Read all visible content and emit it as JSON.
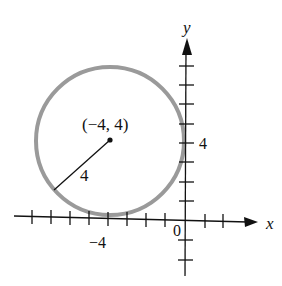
{
  "diagram": {
    "type": "circle-on-coordinate-plane",
    "axes": {
      "x_label": "x",
      "y_label": "y",
      "origin_label": "0",
      "x_tick_label": "−4",
      "y_tick_label": "4"
    },
    "circle": {
      "center_label": "(−4, 4)",
      "center": [
        -4,
        4
      ],
      "radius": 4,
      "radius_label": "4",
      "stroke_color": "#9a9a9a"
    }
  }
}
